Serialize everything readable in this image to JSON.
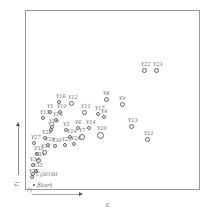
{
  "chart_data": {
    "type": "scatter",
    "title": "",
    "xlabel": "c",
    "ylabel": "",
    "axis_corner_label_x": "7)",
    "axis_corner_label_y": "7)",
    "start_label": "Start",
    "grid": false,
    "legend": null,
    "points": [
      {
        "label": "Y22",
        "x": 144,
        "y": 70,
        "r": 2.5
      },
      {
        "label": "Y23",
        "x": 156,
        "y": 70,
        "r": 2.5
      },
      {
        "label": "Y8",
        "x": 106,
        "y": 99,
        "r": 2.5
      },
      {
        "label": "Y9",
        "x": 122,
        "y": 104,
        "r": 2.5
      },
      {
        "label": "Y12",
        "x": 71,
        "y": 103,
        "r": 2.5
      },
      {
        "label": "Y16",
        "x": 59,
        "y": 102,
        "r": 2.0
      },
      {
        "label": "Y11",
        "x": 84,
        "y": 112,
        "r": 2.5
      },
      {
        "label": "Y17",
        "x": 98,
        "y": 114,
        "r": 2.0
      },
      {
        "label": "Y4",
        "x": 104,
        "y": 117,
        "r": 2.0
      },
      {
        "label": "Y13",
        "x": 131,
        "y": 126,
        "r": 2.5
      },
      {
        "label": "Y21",
        "x": 147,
        "y": 139,
        "r": 2.5
      },
      {
        "label": "Y20",
        "x": 100,
        "y": 135,
        "r": 3.5
      },
      {
        "label": "Y14",
        "x": 89,
        "y": 128,
        "r": 2.0
      },
      {
        "label": "Y1",
        "x": 50,
        "y": 112,
        "r": 2.0
      },
      {
        "label": "Y10",
        "x": 60,
        "y": 112,
        "r": 2.0
      },
      {
        "label": "Y15",
        "x": 43,
        "y": 118,
        "r": 2.0
      },
      {
        "label": "Y18",
        "x": 56,
        "y": 120,
        "r": 2.0
      },
      {
        "label": "Y19",
        "x": 52,
        "y": 127,
        "r": 2.0
      },
      {
        "label": "Y3",
        "x": 51,
        "y": 130,
        "r": 2.0
      },
      {
        "label": "Y5",
        "x": 66,
        "y": 130,
        "r": 2.0
      },
      {
        "label": "Y6",
        "x": 78,
        "y": 128,
        "r": 2.0
      },
      {
        "label": "Y7",
        "x": 82,
        "y": 137,
        "r": 3.0
      },
      {
        "label": "Y24",
        "x": 70,
        "y": 137,
        "r": 2.0
      },
      {
        "label": "Y25",
        "x": 65,
        "y": 145,
        "r": 2.0
      },
      {
        "label": "Y26",
        "x": 74,
        "y": 144,
        "r": 2.0
      },
      {
        "label": "Y27",
        "x": 34,
        "y": 143,
        "r": 2.0
      },
      {
        "label": "Y28",
        "x": 45,
        "y": 138,
        "r": 2.0
      },
      {
        "label": "Y29",
        "x": 48,
        "y": 145,
        "r": 2.0
      },
      {
        "label": "Y30",
        "x": 55,
        "y": 146,
        "r": 2.0
      },
      {
        "label": "Y31",
        "x": 44,
        "y": 152,
        "r": 2.5
      },
      {
        "label": "Y32",
        "x": 37,
        "y": 154,
        "r": 2.0
      },
      {
        "label": "Y33",
        "x": 38,
        "y": 160,
        "r": 2.5
      },
      {
        "label": "Y34",
        "x": 33,
        "y": 165,
        "r": 2.0
      },
      {
        "label": "Y35",
        "x": 36,
        "y": 171,
        "r": 2.0
      },
      {
        "label": "CySO3H",
        "x": 33,
        "y": 174,
        "r": 2.0
      },
      {
        "label": "Y36",
        "x": 32,
        "y": 177,
        "r": 2.0
      }
    ]
  }
}
